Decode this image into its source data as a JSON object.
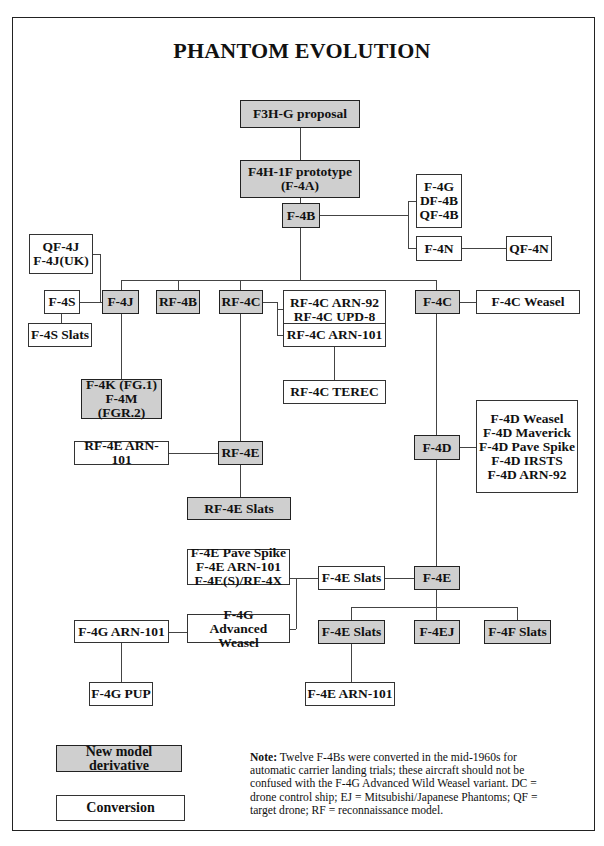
{
  "title": "PHANTOM EVOLUTION",
  "nodes": {
    "f3hg": {
      "label": "F3H-G proposal",
      "type": "new"
    },
    "f4h1f": {
      "label": "F4H-1F prototype\n(F-4A)",
      "type": "new"
    },
    "f4b": {
      "label": "F-4B",
      "type": "new"
    },
    "f4g_df4b_qf4b": {
      "label": "F-4G\nDF-4B\nQF-4B",
      "type": "conversion"
    },
    "f4n": {
      "label": "F-4N",
      "type": "conversion"
    },
    "qf4n": {
      "label": "QF-4N",
      "type": "conversion"
    },
    "qf4j": {
      "label": "QF-4J\nF-4J(UK)",
      "type": "conversion"
    },
    "f4s": {
      "label": "F-4S",
      "type": "conversion"
    },
    "f4j": {
      "label": "F-4J",
      "type": "new"
    },
    "rf4b": {
      "label": "RF-4B",
      "type": "new"
    },
    "rf4c": {
      "label": "RF-4C",
      "type": "new"
    },
    "rf4c_arn92_upd8": {
      "label": "RF-4C ARN-92\nRF-4C UPD-8",
      "type": "conversion"
    },
    "f4c": {
      "label": "F-4C",
      "type": "new"
    },
    "f4c_weasel": {
      "label": "F-4C Weasel",
      "type": "conversion"
    },
    "f4s_slats": {
      "label": "F-4S Slats",
      "type": "conversion"
    },
    "rf4c_arn101": {
      "label": "RF-4C ARN-101",
      "type": "conversion"
    },
    "rf4c_terec": {
      "label": "RF-4C TEREC",
      "type": "conversion"
    },
    "f4k_f4m": {
      "label": "F-4K (FG.1)\nF-4M (FGR.2)",
      "type": "new"
    },
    "f4d": {
      "label": "F-4D",
      "type": "new"
    },
    "f4d_variants": {
      "label": "F-4D Weasel\nF-4D Maverick\nF-4D Pave Spike\nF-4D IRSTS\nF-4D ARN-92",
      "type": "conversion"
    },
    "rf4e_arn101": {
      "label": "RF-4E ARN-101",
      "type": "conversion"
    },
    "rf4e": {
      "label": "RF-4E",
      "type": "new"
    },
    "rf4e_slats": {
      "label": "RF-4E Slats",
      "type": "new"
    },
    "f4e_variants": {
      "label": "F-4E Pave Spike\nF-4E ARN-101\nF-4E(S)/RF-4X",
      "type": "conversion"
    },
    "f4e_slats_conv": {
      "label": "F-4E Slats",
      "type": "conversion"
    },
    "f4e": {
      "label": "F-4E",
      "type": "new"
    },
    "f4g_adv_weasel": {
      "label": "F-4G\nAdvanced Weasel",
      "type": "conversion"
    },
    "f4g_arn101": {
      "label": "F-4G ARN-101",
      "type": "conversion"
    },
    "f4e_slats_new": {
      "label": "F-4E Slats",
      "type": "new"
    },
    "f4ej": {
      "label": "F-4EJ",
      "type": "new"
    },
    "f4f_slats": {
      "label": "F-4F Slats",
      "type": "new"
    },
    "f4g_pup": {
      "label": "F-4G PUP",
      "type": "conversion"
    },
    "f4e_arn101": {
      "label": "F-4E ARN-101",
      "type": "conversion"
    }
  },
  "legend": {
    "new_model": "New model derivative",
    "conversion": "Conversion"
  },
  "note": {
    "label": "Note:",
    "text": " Twelve F-4Bs were converted in the mid-1960s for automatic carrier landing trials; these aircraft should not be confused with the F-4G Advanced Wild Weasel variant. DC = drone control ship; EJ = Mitsubishi/Japanese Phantoms; QF = target drone; RF = reconnaissance model."
  },
  "colors": {
    "new_model_fill": "#cfcfcf",
    "conversion_fill": "#ffffff",
    "line": "#444444"
  }
}
